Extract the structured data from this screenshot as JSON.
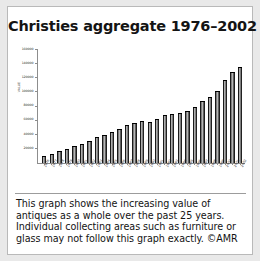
{
  "card": {
    "title": "Christies aggregate 1976–2002"
  },
  "caption": {
    "lines": [
      "This graph shows the increasing value of",
      "antiques as a whole over the past 25 years.",
      "Individual collecting areas such as furniture or",
      "glass may not follow this graph exactly. ©AMR"
    ]
  },
  "colors": {
    "page_background": "#e9e9e9",
    "card_background": "#ffffff",
    "card_border": "#b9b9b9",
    "axis": "#8d8d8d",
    "bar_dark": "#1a1a1a",
    "bar_highlight": "#cfcfcf",
    "text": "#141414"
  },
  "chart_data": {
    "type": "bar",
    "title": "Christies aggregate 1976–2002",
    "xlabel": "",
    "ylabel": "VALUE",
    "ylim": [
      0,
      160000
    ],
    "ytick_values": [
      20000,
      40000,
      60000,
      80000,
      100000,
      120000,
      140000,
      160000
    ],
    "ytick_labels": [
      "20000",
      "40000",
      "60000",
      "80000",
      "100000",
      "120000",
      "140000",
      "160000"
    ],
    "grid": false,
    "legend": null,
    "categories": [
      "1976",
      "1977",
      "1978",
      "1979",
      "1980",
      "1981",
      "1982",
      "1983",
      "1984",
      "1985",
      "1986",
      "1987",
      "1988",
      "1989",
      "1990",
      "1991",
      "1992",
      "1993",
      "1994",
      "1995",
      "1996",
      "1997",
      "1998",
      "1999",
      "2000",
      "2001",
      "2002"
    ],
    "values": [
      8000,
      11000,
      15000,
      19000,
      23000,
      26000,
      30000,
      35000,
      38000,
      43000,
      47000,
      52000,
      55000,
      58000,
      57000,
      61000,
      66000,
      68000,
      70000,
      72000,
      78000,
      86000,
      92000,
      101000,
      116000,
      128000,
      134000
    ]
  }
}
